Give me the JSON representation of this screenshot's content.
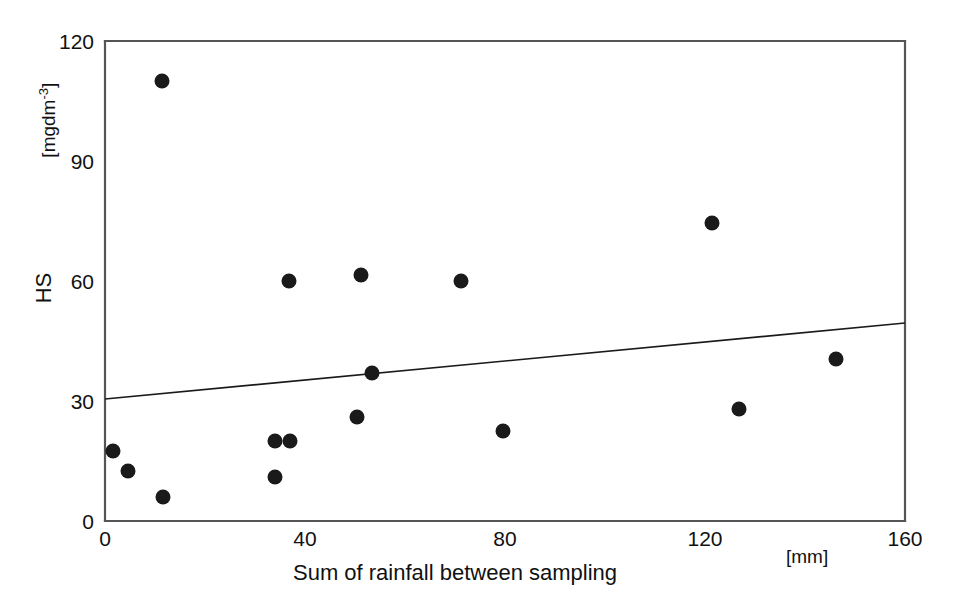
{
  "chart_data": {
    "type": "scatter",
    "title": "",
    "xlabel": "Sum of rainfall between sampling",
    "xunit": "[mm]",
    "ylabel": "HS",
    "yunit": "[mgdm-3]",
    "yunit_base": "[mgdm",
    "yunit_exp": "-3",
    "yunit_close": "]",
    "xlim": [
      0,
      160
    ],
    "ylim": [
      0,
      120
    ],
    "xticks": [
      0,
      40,
      80,
      120,
      160
    ],
    "yticks": [
      0,
      30,
      60,
      90,
      120
    ],
    "xtick_labels": [
      "0",
      "40",
      "80",
      "120",
      "160"
    ],
    "ytick_labels": [
      "0",
      "30",
      "60",
      "90",
      "120"
    ],
    "grid": false,
    "legend": "none",
    "marker": {
      "shape": "circle",
      "color": "#1a1a1a",
      "size": 12
    },
    "points": [
      {
        "x": 1.6,
        "y": 17.5
      },
      {
        "x": 4.6,
        "y": 12.5
      },
      {
        "x": 11.4,
        "y": 110.0
      },
      {
        "x": 11.6,
        "y": 6.0
      },
      {
        "x": 34.0,
        "y": 20.0
      },
      {
        "x": 34.0,
        "y": 11.0
      },
      {
        "x": 37.0,
        "y": 20.0
      },
      {
        "x": 36.8,
        "y": 60.0
      },
      {
        "x": 51.2,
        "y": 61.5
      },
      {
        "x": 50.4,
        "y": 26.0
      },
      {
        "x": 53.4,
        "y": 37.0
      },
      {
        "x": 71.2,
        "y": 60.0
      },
      {
        "x": 79.6,
        "y": 22.5
      },
      {
        "x": 121.4,
        "y": 74.5
      },
      {
        "x": 126.8,
        "y": 28.0
      },
      {
        "x": 146.2,
        "y": 40.5
      }
    ],
    "trendline": {
      "type": "line",
      "x": [
        0,
        160
      ],
      "y": [
        30.5,
        49.5
      ],
      "color": "#1a1a1a",
      "width": 1.6
    }
  },
  "axes": {
    "frame_color": "#555555",
    "tick_color": "#555555"
  }
}
